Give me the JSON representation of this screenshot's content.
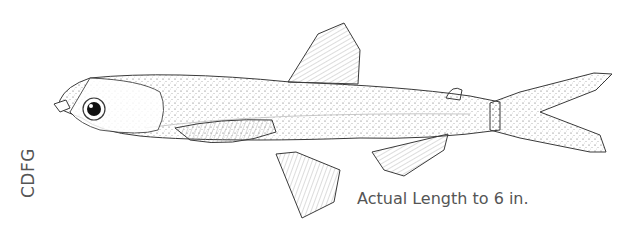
{
  "illustration": {
    "subject": "fish-line-drawing",
    "stroke_color": "#3a3a3a",
    "credit": "CDFG",
    "caption": "Actual Length to 6 in."
  }
}
